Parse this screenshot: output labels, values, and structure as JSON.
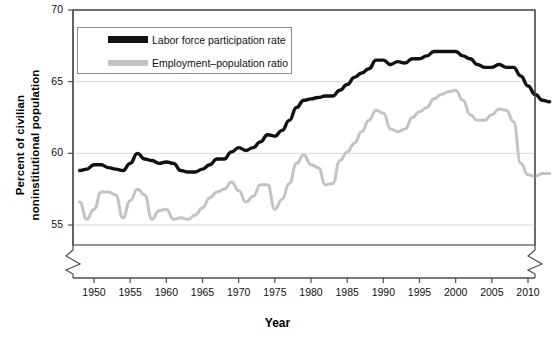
{
  "chart_data": {
    "type": "line",
    "title": "",
    "xlabel": "Year",
    "ylabel": "Percent of civilian noninstitutional population",
    "ylabel_line1": "Percent of civilian",
    "ylabel_line2": "noninstitutional population",
    "ylim": [
      55,
      70
    ],
    "yticks": [
      55,
      60,
      65,
      70
    ],
    "xlim": [
      1948,
      2013
    ],
    "xticks": [
      1950,
      1955,
      1960,
      1965,
      1970,
      1975,
      1980,
      1985,
      1990,
      1995,
      2000,
      2005,
      2010
    ],
    "grid": true,
    "axis_break_y": true,
    "axis_break_x": true,
    "legend_position": "upper-left-inside",
    "colors": {
      "series1": "#111111",
      "series2": "#c3c3c3",
      "grid": "#d9d9d9",
      "axis": "#4d4d4d"
    },
    "x": [
      1948,
      1949,
      1950,
      1951,
      1952,
      1953,
      1954,
      1955,
      1956,
      1957,
      1958,
      1959,
      1960,
      1961,
      1962,
      1963,
      1964,
      1965,
      1966,
      1967,
      1968,
      1969,
      1970,
      1971,
      1972,
      1973,
      1974,
      1975,
      1976,
      1977,
      1978,
      1979,
      1980,
      1981,
      1982,
      1983,
      1984,
      1985,
      1986,
      1987,
      1988,
      1989,
      1990,
      1991,
      1992,
      1993,
      1994,
      1995,
      1996,
      1997,
      1998,
      1999,
      2000,
      2001,
      2002,
      2003,
      2004,
      2005,
      2006,
      2007,
      2008,
      2009,
      2010,
      2011,
      2012,
      2013
    ],
    "series": [
      {
        "name": "Labor force participation rate",
        "color": "#111111",
        "values": [
          58.8,
          58.9,
          59.2,
          59.2,
          59.0,
          58.9,
          58.8,
          59.3,
          60.0,
          59.6,
          59.5,
          59.3,
          59.4,
          59.3,
          58.8,
          58.7,
          58.7,
          58.9,
          59.2,
          59.6,
          59.6,
          60.1,
          60.4,
          60.2,
          60.4,
          60.8,
          61.3,
          61.2,
          61.6,
          62.3,
          63.2,
          63.7,
          63.8,
          63.9,
          64.0,
          64.0,
          64.4,
          64.8,
          65.3,
          65.6,
          65.9,
          66.5,
          66.5,
          66.2,
          66.4,
          66.3,
          66.6,
          66.6,
          66.8,
          67.1,
          67.1,
          67.1,
          67.1,
          66.8,
          66.6,
          66.2,
          66.0,
          66.0,
          66.2,
          66.0,
          66.0,
          65.4,
          64.7,
          64.1,
          63.7,
          63.6
        ]
      },
      {
        "name": "Employment–population ratio",
        "color": "#c3c3c3",
        "values": [
          56.6,
          55.4,
          56.1,
          57.3,
          57.3,
          57.1,
          55.5,
          56.7,
          57.5,
          57.1,
          55.4,
          56.0,
          56.1,
          55.4,
          55.5,
          55.4,
          55.7,
          56.2,
          56.9,
          57.3,
          57.5,
          58.0,
          57.4,
          56.6,
          57.0,
          57.8,
          57.8,
          56.1,
          56.8,
          57.9,
          59.3,
          59.9,
          59.2,
          59.0,
          57.8,
          57.9,
          59.5,
          60.1,
          60.7,
          61.5,
          62.3,
          63.0,
          62.8,
          61.7,
          61.5,
          61.7,
          62.5,
          62.9,
          63.2,
          63.8,
          64.1,
          64.3,
          64.4,
          63.7,
          62.7,
          62.3,
          62.3,
          62.7,
          63.1,
          63.0,
          62.2,
          59.3,
          58.5,
          58.4,
          58.6,
          58.6
        ]
      }
    ]
  },
  "legend": {
    "items": [
      {
        "label": "Labor force participation rate",
        "swatch": "black"
      },
      {
        "label": "Employment–population ratio",
        "swatch": "gray"
      }
    ]
  },
  "axes": {
    "y_tick_labels": [
      "70",
      "65",
      "60",
      "55"
    ],
    "x_tick_labels": [
      "1950",
      "1955",
      "1960",
      "1965",
      "1970",
      "1975",
      "1980",
      "1985",
      "1990",
      "1995",
      "2000",
      "2005",
      "2010"
    ],
    "x_title": "Year",
    "y_title_line1": "Percent of civilian",
    "y_title_line2": "noninstitutional population"
  }
}
